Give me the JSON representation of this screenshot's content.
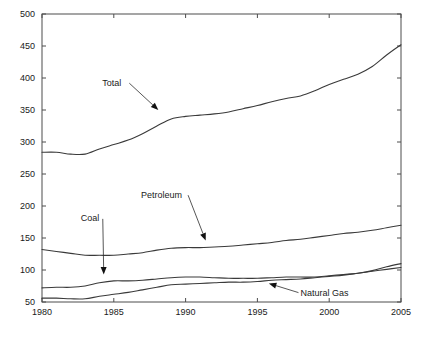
{
  "chart_data": {
    "type": "line",
    "title": "",
    "subtitle": "",
    "xlabel": "",
    "ylabel": "",
    "xlim": [
      1980,
      2005
    ],
    "ylim": [
      50,
      500
    ],
    "xticks": [
      1980,
      1985,
      1990,
      1995,
      2000,
      2005
    ],
    "xtick_labels": [
      "1980",
      "1985",
      "1990",
      "1995",
      "2000",
      "2005"
    ],
    "yticks": [
      50,
      100,
      150,
      200,
      250,
      300,
      350,
      400,
      450,
      500
    ],
    "ytick_labels": [
      "50",
      "100",
      "150",
      "200",
      "250",
      "300",
      "350",
      "400",
      "450",
      "500"
    ],
    "grid": false,
    "legend": "none",
    "line_color": "#3a3a3a",
    "axis_color": "#4d4d4d",
    "background": "#ffffff",
    "x": [
      1980,
      1981,
      1982,
      1983,
      1984,
      1985,
      1986,
      1987,
      1988,
      1989,
      1990,
      1991,
      1992,
      1993,
      1994,
      1995,
      1996,
      1997,
      1998,
      1999,
      2000,
      2001,
      2002,
      2003,
      2004,
      2005
    ],
    "series": [
      {
        "name": "Total",
        "values": [
          284,
          284,
          281,
          281,
          289,
          296,
          303,
          313,
          325,
          336,
          340,
          342,
          344,
          347,
          352,
          357,
          363,
          368,
          372,
          380,
          390,
          398,
          406,
          418,
          436,
          452
        ]
      },
      {
        "name": "Petroleum",
        "values": [
          132,
          129,
          126,
          123,
          123,
          123,
          125,
          127,
          131,
          134,
          135,
          135,
          136,
          137,
          139,
          141,
          143,
          146,
          148,
          151,
          154,
          157,
          159,
          162,
          166,
          170
        ]
      },
      {
        "name": "Coal",
        "values": [
          72,
          73,
          73,
          75,
          80,
          83,
          83,
          84,
          86,
          88,
          89,
          89,
          88,
          87,
          87,
          87,
          88,
          89,
          89,
          89,
          91,
          93,
          95,
          99,
          105,
          110
        ]
      },
      {
        "name": "Natural Gas",
        "values": [
          56,
          56,
          55,
          55,
          59,
          62,
          65,
          69,
          73,
          77,
          78,
          79,
          80,
          81,
          81,
          82,
          84,
          85,
          86,
          88,
          90,
          92,
          95,
          98,
          101,
          104
        ]
      }
    ],
    "annotations": [
      {
        "label": "Total",
        "text_x": 1984.2,
        "text_y": 388,
        "tip_x": 1988.1,
        "tip_y": 350
      },
      {
        "label": "Petroleum",
        "text_x": 1986.9,
        "text_y": 213,
        "tip_x": 1991.4,
        "tip_y": 146
      },
      {
        "label": "Coal",
        "text_x": 1982.7,
        "text_y": 176,
        "tip_x": 1984.3,
        "tip_y": 93
      },
      {
        "label": "Natural Gas",
        "text_x": 1998.0,
        "text_y": 60,
        "tip_x": 1995.8,
        "tip_y": 79
      }
    ]
  }
}
